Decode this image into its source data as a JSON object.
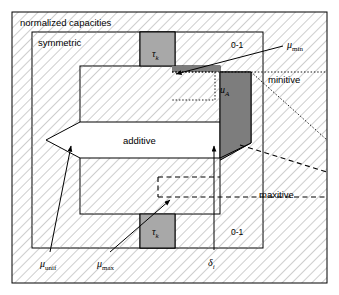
{
  "figure": {
    "type": "set-containment-diagram",
    "title_label": "normalized capacities",
    "regions": [
      {
        "id": "normalized",
        "label": "normalized capacities"
      },
      {
        "id": "symmetric",
        "label": "symmetric"
      },
      {
        "id": "additive",
        "label": "additive"
      },
      {
        "id": "zero-one-top",
        "label": "0-1"
      },
      {
        "id": "zero-one-bottom",
        "label": "0-1"
      },
      {
        "id": "minitive",
        "label": "minitive"
      },
      {
        "id": "maxitive",
        "label": "maxitive"
      },
      {
        "id": "tau-k-top",
        "label": "τ",
        "sub": "k"
      },
      {
        "id": "tau-k-bottom",
        "label": "τ",
        "sub": "k"
      },
      {
        "id": "u-a",
        "label": "u",
        "sub": "A"
      }
    ],
    "labels": {
      "normalized_capacities": "normalized capacities",
      "symmetric": "symmetric",
      "additive": "additive",
      "zero_one_top": "0-1",
      "zero_one_bottom": "0-1",
      "minitive": "minitive",
      "maxitive": "maxitive",
      "tau_base": "τ",
      "tau_sub": "k",
      "u_base": "u",
      "u_sub": "A",
      "mu_base": "μ",
      "mu_min_sub": "min",
      "mu_max_sub": "max",
      "mu_unif_sub": "unif",
      "delta_base": "δ",
      "delta_sub": "i"
    },
    "callouts": [
      {
        "id": "mu-min",
        "base": "μ",
        "sub": "min",
        "target": "u-a top-left corner",
        "line": "solid-arrow"
      },
      {
        "id": "mu-max",
        "base": "μ",
        "sub": "max",
        "target": "tau-k bottom strip",
        "line": "solid-arrow"
      },
      {
        "id": "mu-unif",
        "base": "μ",
        "sub": "unif",
        "target": "additive left vertex",
        "line": "solid-arrow"
      },
      {
        "id": "delta-i",
        "base": "δ",
        "sub": "i",
        "target": "u-a bottom vertex",
        "line": "solid-arrow"
      }
    ],
    "colors": {
      "hatch_line": "#9a9a9a",
      "background": "#ffffff",
      "outline": "#000000",
      "gray_fill": "#a8a8a8",
      "dark_gray_fill": "#7d7d7d",
      "white_fill": "#ffffff"
    },
    "line_styles": {
      "minitive_boundary": "dotted",
      "maxitive_boundary": "dashed",
      "region_outline": "solid"
    }
  }
}
